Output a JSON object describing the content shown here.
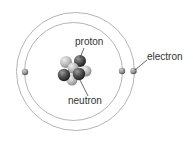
{
  "diagram": {
    "labels": {
      "proton": "proton",
      "neutron": "neutron",
      "electron": "electron"
    },
    "colors": {
      "orbit": "#b5b5b5",
      "electron": "#8a8a8a",
      "proton": "#555555",
      "neutron": "#bdbdbd",
      "leader": "#444444",
      "text": "#333333"
    }
  }
}
